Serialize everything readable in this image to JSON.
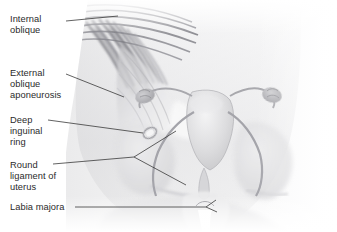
{
  "figure": {
    "type": "anatomical-illustration",
    "style": "grayscale airbrush medical illustration",
    "background_color": "#ffffff",
    "text_color": "#2b2b2b",
    "leader_line_color": "#3a3a3a",
    "width": 337,
    "height": 232
  },
  "labels": [
    {
      "id": "internal-oblique",
      "text": "Internal\noblique",
      "x": 10,
      "y": 14,
      "leader": {
        "x1": 66,
        "y1": 21,
        "x2": 118,
        "y2": 16
      }
    },
    {
      "id": "external-oblique-aponeurosis",
      "text": "External\noblique\naponeurosis",
      "x": 10,
      "y": 68,
      "leader": {
        "x1": 66,
        "y1": 74,
        "x2": 124,
        "y2": 97
      }
    },
    {
      "id": "deep-inguinal-ring",
      "text": "Deep\ninguinal\nring",
      "x": 10,
      "y": 115,
      "leader": {
        "x1": 48,
        "y1": 120,
        "x2": 143,
        "y2": 133
      }
    },
    {
      "id": "round-ligament-of-uterus",
      "text": "Round\nligament of\nuterus",
      "x": 10,
      "y": 160,
      "leader": {
        "x1": 53,
        "y1": 164,
        "x2": 134,
        "y2": 157
      }
    },
    {
      "id": "labia-majora",
      "text": "Labia majora",
      "x": 10,
      "y": 202,
      "leader": {
        "x1": 75,
        "y1": 207,
        "x2": 206,
        "y2": 207
      }
    }
  ],
  "structures": [
    {
      "id": "torso",
      "name": "lower abdominal torso silhouette"
    },
    {
      "id": "muscle-fibers",
      "name": "internal oblique muscle fiber striations"
    },
    {
      "id": "aponeurosis",
      "name": "external oblique aponeurosis sheet"
    },
    {
      "id": "uterus",
      "name": "uterus body and fundus"
    },
    {
      "id": "cervix",
      "name": "cervix"
    },
    {
      "id": "fallopian-tube-left",
      "name": "left fallopian tube"
    },
    {
      "id": "fallopian-tube-right",
      "name": "right fallopian tube"
    },
    {
      "id": "ovary-left",
      "name": "left ovary"
    },
    {
      "id": "ovary-right",
      "name": "right ovary"
    },
    {
      "id": "round-ligament-left",
      "name": "left round ligament cord"
    },
    {
      "id": "round-ligament-right",
      "name": "right round ligament cord"
    },
    {
      "id": "pelvic-bone-left",
      "name": "left iliac bone"
    },
    {
      "id": "pelvic-bone-right",
      "name": "right iliac bone"
    },
    {
      "id": "labia",
      "name": "labia majora / perineal cleft"
    }
  ]
}
